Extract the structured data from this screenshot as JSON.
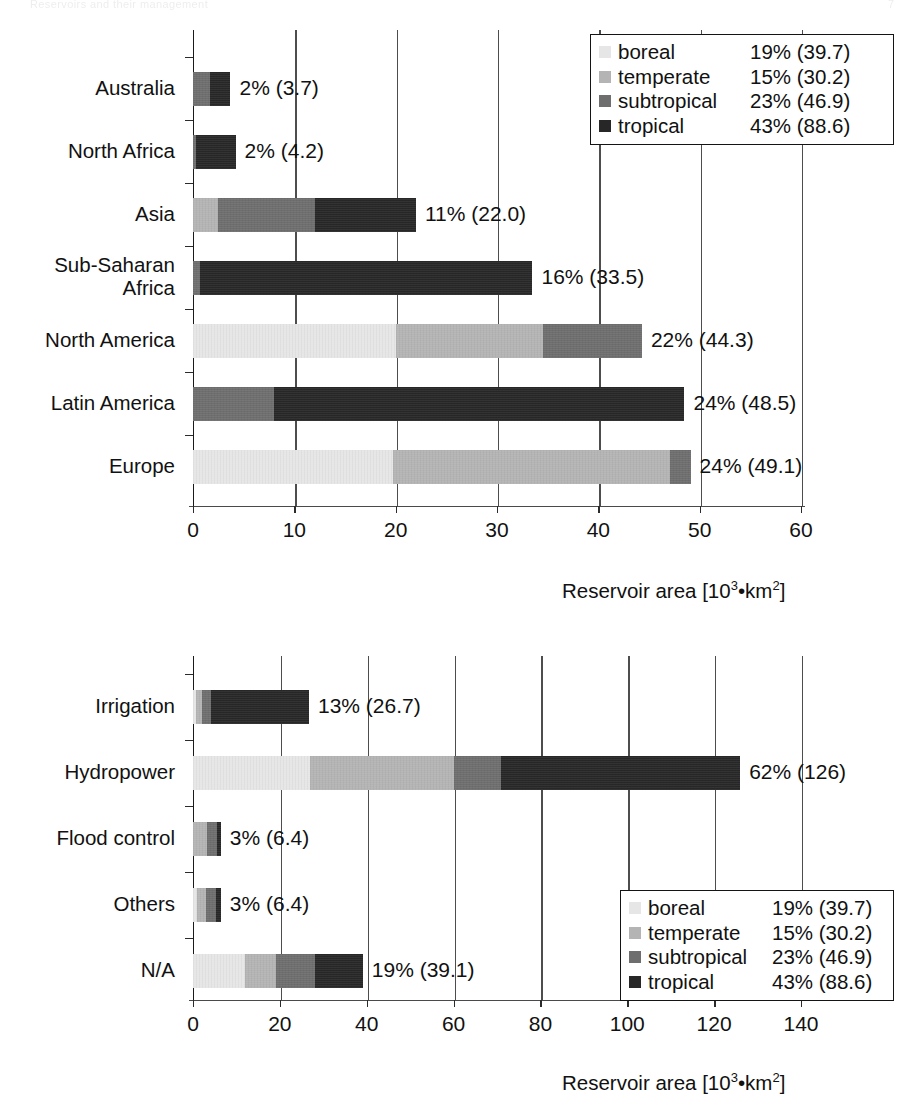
{
  "scan_header": {
    "left_text": "Reservoirs and their management",
    "right_text": "7"
  },
  "legend_title": "climate zone",
  "legend_entries": [
    {
      "key": "boreal",
      "label": "boreal",
      "value": "19% (39.7)",
      "color": "#e6e6e6"
    },
    {
      "key": "temperate",
      "label": "temperate",
      "value": "15% (30.2)",
      "color": "#b4b4b4"
    },
    {
      "key": "subtropical",
      "label": "subtropical",
      "value": "23% (46.9)",
      "color": "#6e6e6e"
    },
    {
      "key": "tropical",
      "label": "tropical",
      "value": "43% (88.6)",
      "color": "#272727"
    }
  ],
  "axis_title": "Reservoir area [10",
  "axis_title_sup1": "3",
  "axis_title_mid": "•km",
  "axis_title_sup2": "2",
  "axis_title_end": "]",
  "chart_data": [
    {
      "id": "by-region",
      "type": "bar",
      "orientation": "horizontal",
      "stacked": true,
      "title": "",
      "xlabel": "Reservoir area [10³•km²]",
      "ylabel": "",
      "xlim": [
        0,
        60
      ],
      "xticks": [
        0,
        10,
        20,
        30,
        40,
        50,
        60
      ],
      "xtick_labels": [
        "0",
        "10",
        "20",
        "30",
        "40",
        "50",
        "60"
      ],
      "grid": true,
      "legend_position": "top-right",
      "series": [
        {
          "name": "boreal",
          "color": "#e6e6e6",
          "values": [
            0.0,
            0.0,
            0.0,
            0.0,
            20.0,
            0.0,
            19.7
          ]
        },
        {
          "name": "temperate",
          "color": "#b4b4b4",
          "values": [
            0.0,
            0.0,
            2.5,
            0.0,
            14.5,
            0.0,
            27.4
          ]
        },
        {
          "name": "subtropical",
          "color": "#6e6e6e",
          "values": [
            1.7,
            0.3,
            9.5,
            0.7,
            9.8,
            8.0,
            2.0
          ]
        },
        {
          "name": "tropical",
          "color": "#272727",
          "values": [
            2.0,
            3.9,
            10.0,
            32.8,
            0.0,
            40.5,
            0.0
          ]
        }
      ],
      "categories": [
        "Australia",
        "North Africa",
        "Asia",
        "Sub-Saharan\nAfrica",
        "North America",
        "Latin America",
        "Europe"
      ],
      "totals": [
        3.7,
        4.2,
        22.0,
        33.5,
        44.3,
        48.5,
        49.1
      ],
      "data_labels": [
        "2% (3.7)",
        "2% (4.2)",
        "11% (22.0)",
        "16% (33.5)",
        "22% (44.3)",
        "24% (48.5)",
        "24% (49.1)"
      ]
    },
    {
      "id": "by-purpose",
      "type": "bar",
      "orientation": "horizontal",
      "stacked": true,
      "title": "",
      "xlabel": "Reservoir area [10³•km²]",
      "ylabel": "",
      "xlim": [
        0,
        140
      ],
      "xticks": [
        0,
        20,
        40,
        60,
        80,
        100,
        120,
        140
      ],
      "xtick_labels": [
        "0",
        "20",
        "40",
        "60",
        "80",
        "100",
        "120",
        "140"
      ],
      "grid": true,
      "legend_position": "bottom-right",
      "series": [
        {
          "name": "boreal",
          "color": "#e6e6e6",
          "values": [
            0.8,
            27.0,
            0.0,
            0.9,
            12.0
          ]
        },
        {
          "name": "temperate",
          "color": "#b4b4b4",
          "values": [
            1.2,
            33.0,
            3.3,
            2.0,
            7.0
          ]
        },
        {
          "name": "subtropical",
          "color": "#6e6e6e",
          "values": [
            2.2,
            11.0,
            2.2,
            2.4,
            9.0
          ]
        },
        {
          "name": "tropical",
          "color": "#272727",
          "values": [
            22.5,
            55.0,
            0.9,
            1.1,
            11.1
          ]
        }
      ],
      "categories": [
        "Irrigation",
        "Hydropower",
        "Flood control",
        "Others",
        "N/A"
      ],
      "totals": [
        26.7,
        126.0,
        6.4,
        6.4,
        39.1
      ],
      "data_labels": [
        "13% (26.7)",
        "62% (126)",
        "3% (6.4)",
        "3% (6.4)",
        "19% (39.1)"
      ]
    }
  ]
}
